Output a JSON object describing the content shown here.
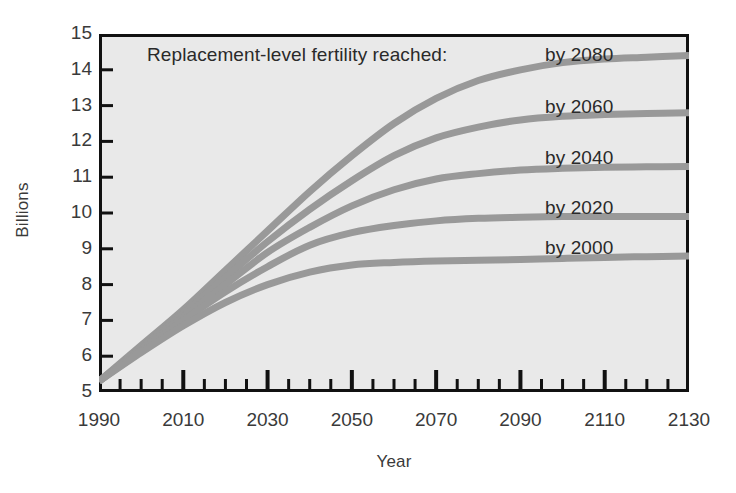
{
  "figure": {
    "background_color": "#ffffff",
    "plot_background_color": "#e9e9e9",
    "frame_color": "#111111",
    "curve_color": "#999999",
    "text_color": "#2a2a2a"
  },
  "caption": "Replacement-level fertility reached:",
  "axes": {
    "x_title": "Year",
    "y_title": "Billions",
    "x_tick_labels": [
      "1990",
      "2010",
      "2030",
      "2050",
      "2070",
      "2090",
      "2110",
      "2130"
    ],
    "y_tick_labels": [
      "15",
      "14",
      "13",
      "12",
      "11",
      "10",
      "9",
      "8",
      "7",
      "6",
      "5"
    ]
  },
  "series_labels": [
    {
      "label": "by 2080"
    },
    {
      "label": "by 2060"
    },
    {
      "label": "by 2040"
    },
    {
      "label": "by 2020"
    },
    {
      "label": "by 2000"
    }
  ],
  "chart_data": {
    "type": "line",
    "title": "Replacement-level fertility reached:",
    "xlabel": "Year",
    "ylabel": "Billions",
    "xlim": [
      1990,
      2130
    ],
    "ylim": [
      5,
      15
    ],
    "xticks": [
      1990,
      2010,
      2030,
      2050,
      2070,
      2090,
      2110,
      2130
    ],
    "yticks": [
      5,
      6,
      7,
      8,
      9,
      10,
      11,
      12,
      13,
      14,
      15
    ],
    "x_minor_tick_interval": 5,
    "grid": false,
    "legend": "inline-right-of-curve",
    "line_color": "#999999",
    "line_width_px": 7,
    "x": [
      1990,
      2000,
      2010,
      2020,
      2030,
      2040,
      2050,
      2060,
      2070,
      2080,
      2090,
      2100,
      2110,
      2120,
      2130
    ],
    "series": [
      {
        "name": "by 2080",
        "values": [
          5.3,
          6.3,
          7.3,
          8.4,
          9.5,
          10.6,
          11.6,
          12.5,
          13.2,
          13.7,
          14.0,
          14.2,
          14.3,
          14.35,
          14.4
        ]
      },
      {
        "name": "by 2060",
        "values": [
          5.3,
          6.25,
          7.2,
          8.2,
          9.2,
          10.1,
          10.9,
          11.6,
          12.1,
          12.4,
          12.6,
          12.7,
          12.75,
          12.78,
          12.8
        ]
      },
      {
        "name": "by 2040",
        "values": [
          5.3,
          6.2,
          7.1,
          8.0,
          8.9,
          9.6,
          10.2,
          10.65,
          10.95,
          11.1,
          11.2,
          11.25,
          11.28,
          11.29,
          11.3
        ]
      },
      {
        "name": "by 2020",
        "values": [
          5.3,
          6.15,
          7.0,
          7.8,
          8.5,
          9.1,
          9.45,
          9.65,
          9.78,
          9.85,
          9.88,
          9.9,
          9.9,
          9.9,
          9.9
        ]
      },
      {
        "name": "by 2000",
        "values": [
          5.3,
          6.1,
          6.85,
          7.5,
          8.0,
          8.35,
          8.55,
          8.62,
          8.66,
          8.68,
          8.7,
          8.73,
          8.76,
          8.78,
          8.8
        ]
      }
    ]
  }
}
